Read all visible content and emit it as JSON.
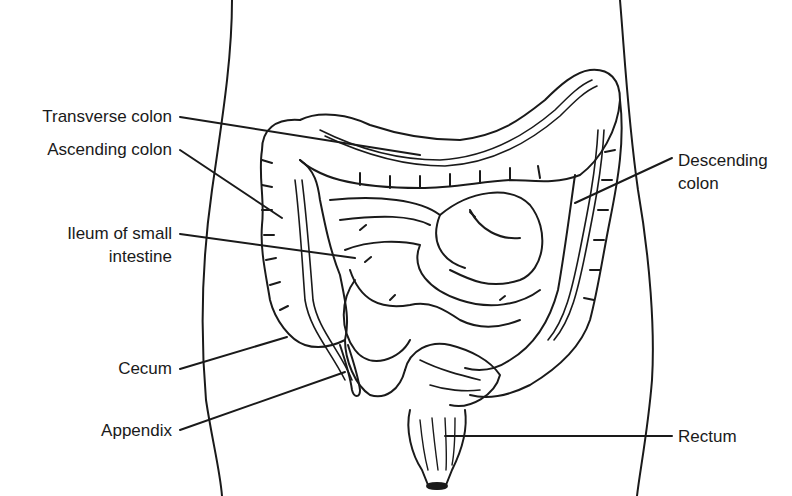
{
  "diagram": {
    "stroke_color": "#1a1a1a",
    "background": "#ffffff",
    "labels": [
      {
        "id": "transverse",
        "text": "Transverse colon"
      },
      {
        "id": "ascending",
        "text": "Ascending colon"
      },
      {
        "id": "ileum_1",
        "text": "Ileum of small"
      },
      {
        "id": "ileum_2",
        "text": "intestine"
      },
      {
        "id": "cecum",
        "text": "Cecum"
      },
      {
        "id": "appendix",
        "text": "Appendix"
      },
      {
        "id": "descending_1",
        "text": "Descending"
      },
      {
        "id": "descending_2",
        "text": "colon"
      },
      {
        "id": "rectum",
        "text": "Rectum"
      }
    ]
  }
}
